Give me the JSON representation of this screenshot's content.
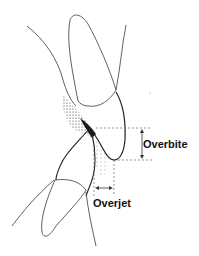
{
  "diagram": {
    "title": "",
    "labels": {
      "overbite": "Overbite",
      "overjet": "Overjet"
    },
    "colors": {
      "line": "#3a3a3a",
      "dash": "#666666",
      "shade": "#222222",
      "background": "#ffffff"
    }
  }
}
